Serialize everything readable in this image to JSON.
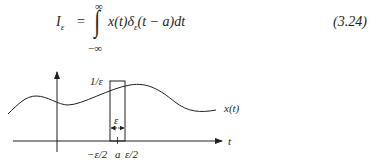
{
  "equation": {
    "lhs": "I",
    "lhs_sub": "ε",
    "equals": "=",
    "upper_limit": "∞",
    "lower_limit": "−∞",
    "integral": "∫",
    "integrand_x": "x(t)",
    "integrand_delta": "δ",
    "integrand_delta_sub": "ε",
    "integrand_arg": "(t − a)dt",
    "number": "(3.24)"
  },
  "figure": {
    "pulse_height_label": "1/ε",
    "pulse_width_label": "ε",
    "signal_label": "x(t)",
    "time_axis_label": "t",
    "tick_labels": [
      "−ε/2",
      "a",
      "ε/2"
    ]
  }
}
